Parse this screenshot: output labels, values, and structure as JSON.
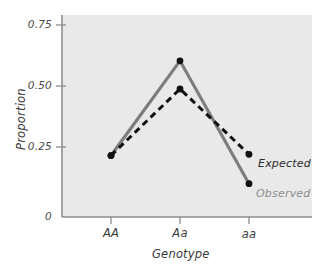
{
  "chart_data": {
    "type": "line",
    "title": "",
    "subtitle": "",
    "xlabel": "Genotype",
    "ylabel": "Proportion",
    "categories": [
      "AA",
      "Aa",
      "aa"
    ],
    "series": [
      {
        "name": "Observed",
        "values": [
          0.24,
          0.61,
          0.13
        ],
        "style": "solid",
        "color": "#7d7d7d",
        "marker": "filled-circle",
        "marker_color": "#111111",
        "label_color": "#8d8d8d"
      },
      {
        "name": "Expected",
        "values": [
          0.24,
          0.5,
          0.245
        ],
        "style": "dashed",
        "color": "#111111",
        "marker": "filled-circle",
        "marker_color": "#111111",
        "label_color": "#2b2b2b"
      }
    ],
    "ylim": [
      0,
      0.8
    ],
    "ytick_values": [
      0,
      0.25,
      0.5,
      0.75
    ],
    "ytick_labels": [
      "0",
      "0.25",
      "0.50",
      "0.75"
    ],
    "xtick_labels": [
      "AA",
      "Aa",
      "aa"
    ],
    "grid": false,
    "legend_position": "inline-right",
    "panel_background": "#e9e9e9",
    "axis_color": "#8d8d8d",
    "figure_background": "#ffffff"
  },
  "axis": {
    "y_title": "Proportion",
    "x_title": "Genotype",
    "y_ticks": [
      {
        "label": "0.75",
        "value": 0.75
      },
      {
        "label": "0.50",
        "value": 0.5
      },
      {
        "label": "0.25",
        "value": 0.25
      },
      {
        "label": "0",
        "value": 0
      }
    ],
    "x_ticks": [
      {
        "label": "AA"
      },
      {
        "label": "Aa"
      },
      {
        "label": "aa"
      }
    ]
  },
  "legend": {
    "expected_label": "Expected",
    "observed_label": "Observed"
  }
}
